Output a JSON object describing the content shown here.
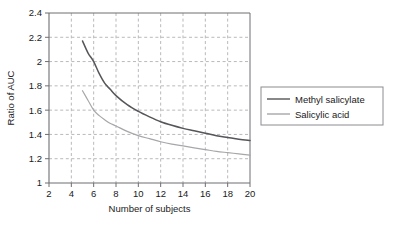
{
  "chart_data": {
    "type": "line",
    "title": "",
    "subtitle": "",
    "xlabel": "Number of subjects",
    "ylabel": "Ratio of AUC",
    "xlim": [
      2,
      20
    ],
    "ylim": [
      1,
      2.4
    ],
    "xticks": [
      2,
      4,
      6,
      8,
      10,
      12,
      14,
      16,
      18,
      20
    ],
    "xtick_labels": [
      "2",
      "4",
      "6",
      "8",
      "10",
      "12",
      "14",
      "16",
      "18",
      "20"
    ],
    "yticks": [
      1,
      1.2,
      1.4,
      1.6,
      1.8,
      2,
      2.2,
      2.4
    ],
    "ytick_labels": [
      "1",
      "1.2",
      "1.4",
      "1.6",
      "1.8",
      "2",
      "2.2",
      "2.4"
    ],
    "grid": true,
    "grid_style": "dashed",
    "grid_axes": "both",
    "legend_position": "right-outside",
    "series": [
      {
        "name": "Methyl salicylate",
        "color": "#55555a",
        "x": [
          5,
          5.5,
          6,
          6.5,
          7,
          7.5,
          8,
          9,
          10,
          11,
          12,
          13,
          14,
          15,
          16,
          17,
          18,
          19,
          20
        ],
        "values": [
          2.17,
          2.07,
          2.0,
          1.9,
          1.82,
          1.77,
          1.72,
          1.645,
          1.59,
          1.545,
          1.505,
          1.475,
          1.45,
          1.43,
          1.41,
          1.39,
          1.375,
          1.36,
          1.35
        ]
      },
      {
        "name": "Salicylic acid",
        "color": "#a7a7ab",
        "x": [
          5,
          5.5,
          6,
          6.5,
          7,
          7.5,
          8,
          9,
          10,
          11,
          12,
          13,
          14,
          15,
          16,
          17,
          18,
          19,
          20
        ],
        "values": [
          1.76,
          1.68,
          1.6,
          1.555,
          1.52,
          1.49,
          1.47,
          1.425,
          1.39,
          1.365,
          1.34,
          1.32,
          1.305,
          1.29,
          1.275,
          1.26,
          1.25,
          1.24,
          1.23
        ]
      }
    ]
  },
  "legend": {
    "entries": [
      {
        "label": "Methyl salicylate"
      },
      {
        "label": "Salicylic acid"
      }
    ]
  },
  "colors": {
    "series_dark": "#55555a",
    "series_light": "#a7a7ab",
    "axis": "#6e6e72",
    "grid": "#b9b9bd",
    "legend_border": "#8c8c90",
    "text": "#1a1a1a",
    "background": "#ffffff"
  }
}
